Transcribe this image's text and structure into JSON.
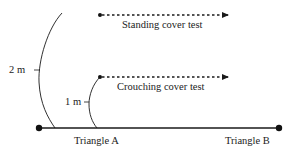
{
  "diagram": {
    "tests": [
      {
        "label": "Standing cover test",
        "height_label": "2 m"
      },
      {
        "label": "Crouching cover test",
        "height_label": "1 m"
      }
    ],
    "points": [
      {
        "label": "Triangle A"
      },
      {
        "label": "Triangle B"
      }
    ],
    "colors": {
      "line": "#1a1a1a",
      "text": "#222222",
      "background": "#ffffff"
    }
  }
}
